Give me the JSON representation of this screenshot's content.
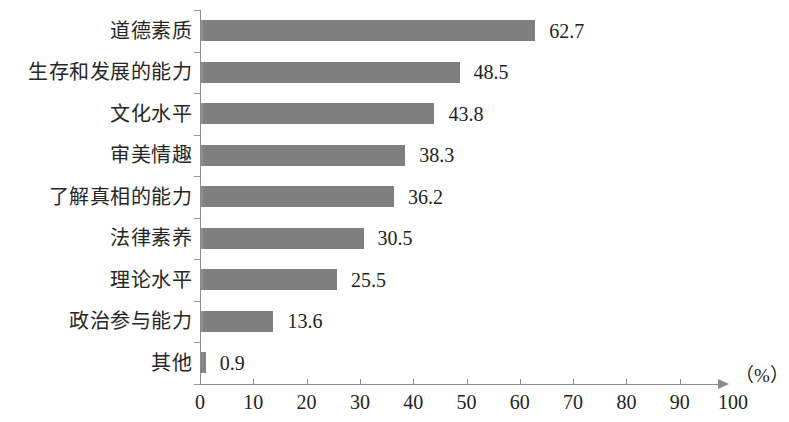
{
  "chart_data": {
    "type": "bar",
    "orientation": "horizontal",
    "title": "",
    "subtitle": "",
    "xlabel": "(%)",
    "ylabel": "",
    "categories": [
      "道德素质",
      "生存和发展的能力",
      "文化水平",
      "审美情趣",
      "了解真相的能力",
      "法律素养",
      "理论水平",
      "政治参与能力",
      "其他"
    ],
    "values": [
      62.7,
      48.5,
      43.8,
      38.3,
      36.2,
      30.5,
      25.5,
      13.6,
      0.9
    ],
    "value_labels": [
      "62.7",
      "48.5",
      "43.8",
      "38.3",
      "36.2",
      "30.5",
      "25.5",
      "13.6",
      "0.9"
    ],
    "xlim": [
      0,
      100
    ],
    "xticks": [
      0,
      10,
      20,
      30,
      40,
      50,
      60,
      70,
      80,
      90,
      100
    ],
    "xtick_labels": [
      "0",
      "10",
      "20",
      "30",
      "40",
      "50",
      "60",
      "70",
      "80",
      "90",
      "100"
    ],
    "grid": false,
    "legend": null,
    "bar_color": "#848484",
    "axis_color": "#8a8a8a",
    "text_color": "#222222",
    "axis_unit_label": "（%）",
    "axis_has_arrow": true
  }
}
